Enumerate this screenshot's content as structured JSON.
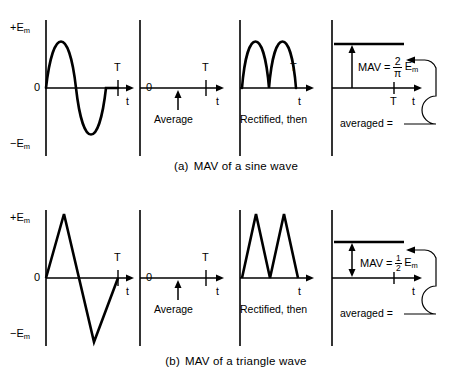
{
  "figure": {
    "rows": [
      {
        "id": "sine",
        "caption_tag": "(a)",
        "caption_text": "MAV of a sine wave",
        "panels": {
          "waveform": {
            "label_top": "+E",
            "label_top_sub": "m",
            "label_zero": "0",
            "label_bottom": "−E",
            "label_bottom_sub": "m",
            "label_period": "T",
            "label_time": "t",
            "wave_type": "sine"
          },
          "average": {
            "label_zero": "0",
            "label_period": "T",
            "label_time": "t",
            "label_note": "Average"
          },
          "rectified": {
            "label_period": "T",
            "label_time": "t",
            "label_note": "Rectified, then",
            "wave_type": "rectified-sine"
          },
          "result": {
            "mav_label": "MAV =",
            "mav_numerator": "2",
            "mav_denominator": "π",
            "mav_symbol": "E",
            "mav_symbol_sub": "m",
            "label_period": "T",
            "label_time": "t",
            "label_note": "averaged =",
            "mav_value": 0.6366,
            "arrow_style": "single"
          }
        }
      },
      {
        "id": "triangle",
        "caption_tag": "(b)",
        "caption_text": "MAV of a triangle wave",
        "panels": {
          "waveform": {
            "label_top": "+E",
            "label_top_sub": "m",
            "label_zero": "0",
            "label_bottom": "−E",
            "label_bottom_sub": "m",
            "label_period": "T",
            "label_time": "t",
            "wave_type": "triangle"
          },
          "average": {
            "label_zero": "0",
            "label_period": "T",
            "label_time": "t",
            "label_note": "Average"
          },
          "rectified": {
            "label_time": "t",
            "label_note": "Rectified, then",
            "wave_type": "rectified-triangle"
          },
          "result": {
            "mav_label": "MAV =",
            "mav_numerator": "1",
            "mav_denominator": "2",
            "mav_symbol": "E",
            "mav_symbol_sub": "m",
            "label_time": "t",
            "label_note": "averaged =",
            "mav_value": 0.5,
            "arrow_style": "double"
          }
        }
      }
    ],
    "colors": {
      "ink": "#000000",
      "background": "#ffffff"
    }
  }
}
